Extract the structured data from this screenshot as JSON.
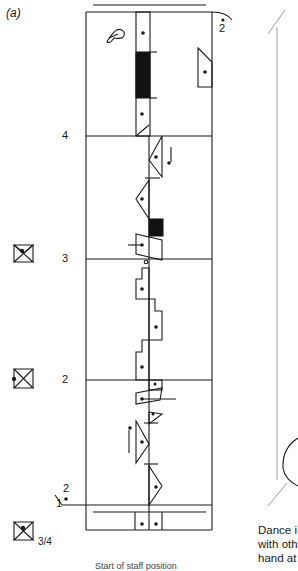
{
  "figure": {
    "label": "(a)",
    "type": "Labanotation score"
  },
  "staff": {
    "measure_numbers": [
      {
        "value": "4",
        "y": 136
      },
      {
        "value": "3",
        "y": 259
      },
      {
        "value": "2",
        "y": 380
      },
      {
        "value": "1",
        "y": 506
      }
    ],
    "cadence_markers": [
      {
        "value": "2",
        "position": "top-right"
      },
      {
        "value": "2",
        "position": "bottom-left"
      }
    ]
  },
  "left_symbols": {
    "meter_fraction": "3/4",
    "items": [
      {
        "name": "relationship-sign-measure-3",
        "y": 255
      },
      {
        "name": "relationship-sign-measure-2",
        "y": 378
      },
      {
        "name": "relationship-sign-start",
        "y": 534
      }
    ]
  },
  "right_panel": {
    "caption_lines": [
      "Dance i",
      "with oth",
      "hand at"
    ]
  },
  "bottom_caption": "Start of staff position"
}
